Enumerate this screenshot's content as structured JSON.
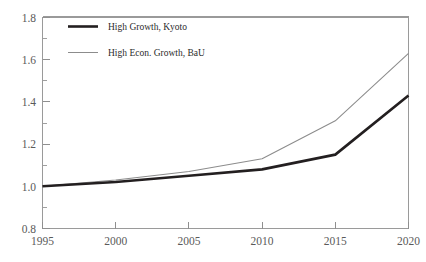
{
  "chart_data": {
    "type": "line",
    "title": "",
    "subtitle": "",
    "xlabel": "",
    "ylabel": "",
    "x": [
      1995,
      2000,
      2005,
      2010,
      2015,
      2020
    ],
    "xtick_labels": [
      "1995",
      "2000",
      "2005",
      "2010",
      "2015",
      "2020"
    ],
    "ytick_labels": [
      "0.8",
      "1.0",
      "1.2",
      "1.4",
      "1.6",
      "1.8"
    ],
    "ytick_values": [
      0.8,
      1.0,
      1.2,
      1.4,
      1.6,
      1.8
    ],
    "xlim": [
      1995,
      2020
    ],
    "ylim": [
      0.8,
      1.8
    ],
    "y_minor_step": 0.1,
    "grid": false,
    "legend_position": "upper-left-inside",
    "series": [
      {
        "name": "High Growth, Kyoto",
        "values": [
          1.0,
          1.02,
          1.05,
          1.08,
          1.15,
          1.43
        ],
        "color": "#231f20",
        "line_width": "thick",
        "style": "solid"
      },
      {
        "name": "High Econ. Growth, BaU",
        "values": [
          1.0,
          1.03,
          1.07,
          1.13,
          1.31,
          1.63
        ],
        "color": "#8c8c8c",
        "line_width": "thin",
        "style": "solid"
      }
    ]
  },
  "axes": {
    "y_ticks": [
      {
        "label": "0.8"
      },
      {
        "label": "1.0"
      },
      {
        "label": "1.2"
      },
      {
        "label": "1.4"
      },
      {
        "label": "1.6"
      },
      {
        "label": "1.8"
      }
    ],
    "x_ticks": [
      {
        "label": "1995"
      },
      {
        "label": "2000"
      },
      {
        "label": "2005"
      },
      {
        "label": "2010"
      },
      {
        "label": "2015"
      },
      {
        "label": "2020"
      }
    ]
  },
  "legend": {
    "entries": [
      {
        "label": "High Growth, Kyoto"
      },
      {
        "label": "High Econ. Growth, BaU"
      }
    ]
  },
  "colors": {
    "kyoto_line": "#231f20",
    "bau_line": "#8c8c8c",
    "axis": "#9a9a9a",
    "tick_text": "#5a5a5a",
    "legend_text": "#2b2b2b",
    "background": "#ffffff"
  }
}
